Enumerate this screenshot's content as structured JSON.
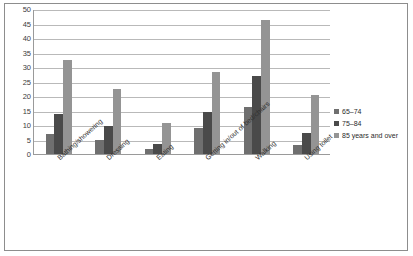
{
  "chart_data": {
    "type": "bar",
    "title": "",
    "xlabel": "",
    "ylabel": "",
    "ylim": [
      0,
      50
    ],
    "ytick_step": 5,
    "yticks": [
      "0",
      "5",
      "10",
      "15",
      "20",
      "25",
      "30",
      "35",
      "40",
      "45",
      "50"
    ],
    "grid": true,
    "legend_position": "right",
    "categories": [
      "Bathing/showering",
      "Dressing",
      "Eating",
      "Getting in/out of bed/chairs",
      "Walking",
      "Using toilet"
    ],
    "series": [
      {
        "name": "65–74",
        "color": "#6f6f6f",
        "values": [
          6.8,
          5.0,
          1.6,
          8.9,
          16.3,
          3.0
        ]
      },
      {
        "name": "75–84",
        "color": "#4a4a4a",
        "values": [
          13.8,
          9.6,
          3.4,
          14.6,
          27.0,
          7.1
        ]
      },
      {
        "name": "85 years and over",
        "color": "#949494",
        "values": [
          32.3,
          22.3,
          10.7,
          28.2,
          46.3,
          20.2
        ]
      }
    ]
  }
}
